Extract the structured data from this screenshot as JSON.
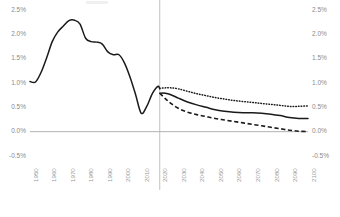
{
  "chart_data": {
    "type": "line",
    "title": "",
    "subtitle": "",
    "xlabel": "",
    "ylabel": "",
    "xlim": [
      1950,
      2100
    ],
    "ylim": [
      -0.5,
      2.5
    ],
    "grid": false,
    "legend_position": "none",
    "y_tick_labels": [
      "2.5%",
      "2.0%",
      "1.5%",
      "1.0%",
      "0.5%",
      "0.0%",
      "-0.5%"
    ],
    "y_tick_values": [
      2.5,
      2.0,
      1.5,
      1.0,
      0.5,
      0.0,
      -0.5
    ],
    "y_axis_left_labels": [
      "2.5%",
      "2.0%",
      "1.5%",
      "1.0%",
      "0.5%",
      "0.0%",
      "-0.5%"
    ],
    "y_axis_right_labels": [
      "2.5%",
      "2.0%",
      "1.5%",
      "1.0%",
      "0.5%",
      "0.0%",
      "-0.5%"
    ],
    "x_tick_labels": [
      "1950",
      "1960",
      "1970",
      "1980",
      "1990",
      "2000",
      "2010",
      "2020",
      "2030",
      "2040",
      "2050",
      "2060",
      "2070",
      "2080",
      "2090",
      "2100"
    ],
    "x_tick_values": [
      1950,
      1960,
      1970,
      1980,
      1990,
      2000,
      2010,
      2020,
      2030,
      2040,
      2050,
      2060,
      2070,
      2080,
      2090,
      2100
    ],
    "annotations": [
      {
        "name": "projection-divider",
        "x": 2020,
        "style": "vertical-line",
        "label": ""
      },
      {
        "name": "zero-axis",
        "y": 0.0,
        "style": "horizontal-line",
        "label": ""
      }
    ],
    "series": [
      {
        "name": "Historical",
        "style": "solid",
        "color": "#1a1a1a",
        "x": [
          1950,
          1953,
          1956,
          1959,
          1962,
          1965,
          1968,
          1971,
          1974,
          1977,
          1980,
          1983,
          1986,
          1989,
          1992,
          1995,
          1998,
          2001,
          2004,
          2007,
          2010,
          2013,
          2016,
          2019,
          2020
        ],
        "values": [
          1.03,
          1.02,
          1.22,
          1.52,
          1.85,
          2.05,
          2.17,
          2.28,
          2.29,
          2.21,
          1.92,
          1.85,
          1.84,
          1.8,
          1.64,
          1.58,
          1.58,
          1.41,
          1.12,
          0.76,
          0.38,
          0.52,
          0.78,
          0.93,
          0.88
        ]
      },
      {
        "name": "High variant",
        "style": "dotted",
        "color": "#1a1a1a",
        "x": [
          2020,
          2023,
          2026,
          2030,
          2035,
          2040,
          2045,
          2050,
          2055,
          2060,
          2065,
          2070,
          2075,
          2080,
          2085,
          2090,
          2095,
          2100
        ],
        "values": [
          0.89,
          0.9,
          0.9,
          0.88,
          0.83,
          0.78,
          0.74,
          0.7,
          0.67,
          0.64,
          0.62,
          0.6,
          0.58,
          0.56,
          0.54,
          0.52,
          0.52,
          0.53
        ]
      },
      {
        "name": "Medium variant",
        "style": "solid",
        "color": "#1a1a1a",
        "x": [
          2020,
          2023,
          2026,
          2030,
          2035,
          2040,
          2045,
          2050,
          2055,
          2060,
          2065,
          2070,
          2075,
          2080,
          2085,
          2090,
          2095,
          2100
        ],
        "values": [
          0.79,
          0.79,
          0.76,
          0.69,
          0.61,
          0.55,
          0.5,
          0.45,
          0.42,
          0.4,
          0.39,
          0.39,
          0.38,
          0.36,
          0.33,
          0.29,
          0.27,
          0.27
        ]
      },
      {
        "name": "Low variant",
        "style": "dashed",
        "color": "#1a1a1a",
        "x": [
          2020,
          2023,
          2026,
          2030,
          2035,
          2040,
          2045,
          2050,
          2055,
          2060,
          2065,
          2070,
          2075,
          2080,
          2085,
          2090,
          2095,
          2100
        ],
        "values": [
          0.79,
          0.68,
          0.58,
          0.48,
          0.4,
          0.35,
          0.31,
          0.27,
          0.24,
          0.21,
          0.18,
          0.15,
          0.12,
          0.09,
          0.06,
          0.03,
          0.01,
          0.0
        ]
      }
    ]
  }
}
